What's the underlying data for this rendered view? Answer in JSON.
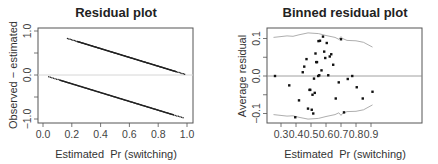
{
  "chart_data": [
    {
      "type": "scatter",
      "title": "Residual plot",
      "xlabel": "Estimated  Pr (switching)",
      "ylabel": "Observed − estimated",
      "xlim": [
        0.0,
        1.0
      ],
      "ylim": [
        -1.0,
        1.0
      ],
      "xticks": [
        "0.0",
        "0.2",
        "0.4",
        "0.6",
        "0.8",
        "1.0"
      ],
      "yticks": [
        "−1.0",
        "0.0",
        "1.0"
      ],
      "grid": false,
      "reference_line": {
        "y": 0.0,
        "color": "#d0d0d0"
      },
      "series": [
        {
          "name": "y=1 (switched)",
          "x_range": [
            0.17,
            0.99
          ],
          "formula": "1 - x",
          "y_range": [
            0.83,
            0.01
          ]
        },
        {
          "name": "y=0 (did not switch)",
          "x_range": [
            0.04,
            0.98
          ],
          "formula": "-x",
          "y_range": [
            -0.04,
            -0.98
          ]
        }
      ]
    },
    {
      "type": "scatter",
      "title": "Binned residual plot",
      "xlabel": "Estimated  Pr (switching)",
      "ylabel": "Average residual",
      "xlim": [
        0.24,
        0.92
      ],
      "ylim": [
        -0.12,
        0.12
      ],
      "xticks": [
        "0.3",
        "0.4",
        "0.5",
        "0.6",
        "0.7",
        "0.8",
        "0.9"
      ],
      "yticks": [
        "−0.1",
        "0.0",
        "0.1"
      ],
      "grid": false,
      "reference_line": {
        "y": 0.0,
        "color": "#888888"
      },
      "points": [
        {
          "x": 0.26,
          "y": 0.0
        },
        {
          "x": 0.355,
          "y": -0.025
        },
        {
          "x": 0.395,
          "y": -0.11
        },
        {
          "x": 0.42,
          "y": -0.065
        },
        {
          "x": 0.445,
          "y": 0.01
        },
        {
          "x": 0.455,
          "y": 0.025
        },
        {
          "x": 0.47,
          "y": 0.045
        },
        {
          "x": 0.48,
          "y": -0.087
        },
        {
          "x": 0.49,
          "y": -0.037
        },
        {
          "x": 0.495,
          "y": -0.037
        },
        {
          "x": 0.505,
          "y": -0.09
        },
        {
          "x": 0.51,
          "y": -0.05
        },
        {
          "x": 0.515,
          "y": -0.1
        },
        {
          "x": 0.52,
          "y": -0.007
        },
        {
          "x": 0.525,
          "y": -0.045
        },
        {
          "x": 0.53,
          "y": 0.06
        },
        {
          "x": 0.535,
          "y": 0.037
        },
        {
          "x": 0.54,
          "y": 0.037
        },
        {
          "x": 0.548,
          "y": 0.0
        },
        {
          "x": 0.55,
          "y": 0.093
        },
        {
          "x": 0.555,
          "y": 0.002
        },
        {
          "x": 0.56,
          "y": 0.094
        },
        {
          "x": 0.57,
          "y": 0.015
        },
        {
          "x": 0.58,
          "y": 0.105
        },
        {
          "x": 0.588,
          "y": 0.065
        },
        {
          "x": 0.595,
          "y": 0.048
        },
        {
          "x": 0.605,
          "y": 0.088
        },
        {
          "x": 0.615,
          "y": 0.002
        },
        {
          "x": 0.625,
          "y": 0.052
        },
        {
          "x": 0.635,
          "y": 0.058
        },
        {
          "x": 0.648,
          "y": 0.03
        },
        {
          "x": 0.665,
          "y": -0.06
        },
        {
          "x": 0.685,
          "y": -0.017
        },
        {
          "x": 0.7,
          "y": 0.098
        },
        {
          "x": 0.72,
          "y": -0.097
        },
        {
          "x": 0.745,
          "y": -0.008
        },
        {
          "x": 0.775,
          "y": 0.0
        },
        {
          "x": 0.805,
          "y": -0.03
        },
        {
          "x": 0.845,
          "y": -0.06
        },
        {
          "x": 0.91,
          "y": -0.042
        }
      ],
      "bounds_upper": [
        [
          0.25,
          0.103
        ],
        [
          0.34,
          0.107
        ],
        [
          0.38,
          0.106
        ],
        [
          0.42,
          0.11
        ],
        [
          0.48,
          0.115
        ],
        [
          0.55,
          0.113
        ],
        [
          0.6,
          0.108
        ],
        [
          0.66,
          0.103
        ],
        [
          0.685,
          0.098
        ],
        [
          0.7,
          0.105
        ],
        [
          0.71,
          0.1
        ],
        [
          0.74,
          0.095
        ],
        [
          0.8,
          0.094
        ],
        [
          0.85,
          0.09
        ],
        [
          0.91,
          0.077
        ]
      ],
      "bounds_lower": [
        [
          0.25,
          -0.103
        ],
        [
          0.34,
          -0.107
        ],
        [
          0.38,
          -0.106
        ],
        [
          0.42,
          -0.11
        ],
        [
          0.48,
          -0.115
        ],
        [
          0.55,
          -0.113
        ],
        [
          0.6,
          -0.108
        ],
        [
          0.66,
          -0.103
        ],
        [
          0.685,
          -0.098
        ],
        [
          0.7,
          -0.105
        ],
        [
          0.71,
          -0.1
        ],
        [
          0.74,
          -0.095
        ],
        [
          0.8,
          -0.094
        ],
        [
          0.85,
          -0.09
        ],
        [
          0.91,
          -0.077
        ]
      ]
    }
  ]
}
